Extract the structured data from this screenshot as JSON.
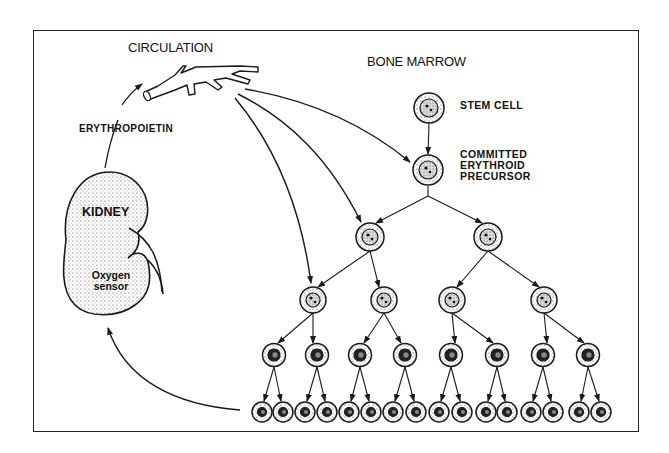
{
  "labels": {
    "circulation": "CIRCULATION",
    "bone_marrow": "BONE MARROW",
    "erythropoietin": "ERYTHROPOIETIN",
    "kidney": "KIDNEY",
    "oxygen_sensor_line1": "Oxygen",
    "oxygen_sensor_line2": "sensor",
    "stem_cell": "STEM CELL",
    "committed_line1": "COMMITTED",
    "committed_line2": "ERYTHROID",
    "committed_line3": "PRECURSOR"
  },
  "colors": {
    "line": "#1a1a1a",
    "background": "#ffffff",
    "stipple": "#555555"
  },
  "tree": {
    "stem": {
      "x": 429,
      "y": 108,
      "r": 15
    },
    "committed": {
      "x": 428,
      "y": 170,
      "r": 15
    },
    "level2": [
      {
        "x": 370,
        "y": 237
      },
      {
        "x": 488,
        "y": 237
      }
    ],
    "level3": [
      {
        "x": 313,
        "y": 300
      },
      {
        "x": 384,
        "y": 300
      },
      {
        "x": 452,
        "y": 300
      },
      {
        "x": 544,
        "y": 300
      }
    ],
    "level4": [
      274,
      317,
      360,
      405,
      451,
      497,
      543,
      588
    ],
    "level5": [
      262,
      283,
      305,
      327,
      349,
      371,
      393,
      416,
      439,
      462,
      486,
      507,
      531,
      553,
      579,
      601
    ]
  }
}
